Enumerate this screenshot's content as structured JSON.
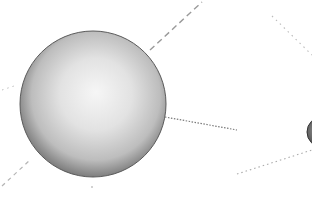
{
  "diagram": {
    "background": "#ffffff",
    "spheres": [
      {
        "id": "main",
        "cx": 93,
        "cy": 104,
        "r": 73,
        "fill_light": "#f4f4f4",
        "fill_mid": "#c8c8c8",
        "fill_dark": "#7a7a7a",
        "stroke": "#555555"
      },
      {
        "id": "edge",
        "cx": 322,
        "cy": 132,
        "r": 15,
        "fill_light": "#9a9a9a",
        "fill_mid": "#666666",
        "fill_dark": "#3a3a3a",
        "stroke": "#333333"
      }
    ],
    "lines": [
      {
        "id": "upper-dashed",
        "x1": 150,
        "y1": 50,
        "x2": 202,
        "y2": 2,
        "color": "#9a9a9a",
        "dash": "6,4",
        "width": 1.4
      },
      {
        "id": "middle-dotted",
        "x1": 165,
        "y1": 117,
        "x2": 237,
        "y2": 130,
        "color": "#7a7a7a",
        "dash": "1.5,1.5",
        "width": 1.2
      },
      {
        "id": "lower-right-dotted",
        "x1": 237,
        "y1": 174,
        "x2": 312,
        "y2": 150,
        "color": "#aaaaaa",
        "dash": "1.5,3",
        "width": 1.1
      },
      {
        "id": "upper-right-dotted",
        "x1": 272,
        "y1": 16,
        "x2": 312,
        "y2": 55,
        "color": "#bbbbbb",
        "dash": "1.5,4",
        "width": 1.1
      },
      {
        "id": "lower-left-dashed",
        "x1": 2,
        "y1": 186,
        "x2": 30,
        "y2": 160,
        "color": "#b5b5b5",
        "dash": "4,4",
        "width": 1.2
      },
      {
        "id": "left-dotted",
        "x1": 2,
        "y1": 90,
        "x2": 14,
        "y2": 86,
        "color": "#c0c0c0",
        "dash": "1.5,4",
        "width": 1
      }
    ]
  }
}
